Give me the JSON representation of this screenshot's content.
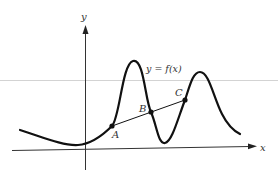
{
  "diagram": {
    "type": "function-graph-secant",
    "axes": {
      "x_label": "x",
      "y_label": "y"
    },
    "curve_label": "y = f(x)",
    "points": [
      {
        "label": "A",
        "x": 112,
        "y": 126
      },
      {
        "label": "B",
        "x": 151,
        "y": 112
      },
      {
        "label": "C",
        "x": 185,
        "y": 100
      }
    ],
    "colors": {
      "stroke": "#111111",
      "axis": "#333333",
      "guide_line": "#c8c8c8",
      "background": "#ffffff"
    }
  }
}
